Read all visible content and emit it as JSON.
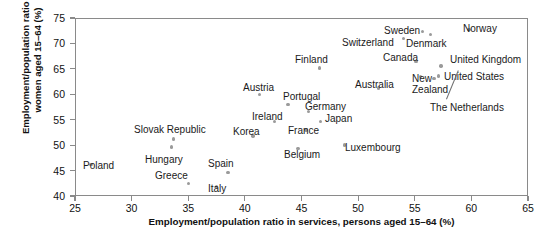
{
  "chart_data": {
    "type": "scatter",
    "title": "",
    "xlabel": "Employment/population ratio in services, persons aged 15–64 (%)",
    "ylabel": "Employment/population ratio for women aged 15–64 (%)",
    "xlim": [
      25,
      65
    ],
    "ylim": [
      40,
      75
    ],
    "xticks": [
      25,
      30,
      35,
      40,
      45,
      50,
      55,
      60,
      65
    ],
    "yticks": [
      40,
      45,
      50,
      55,
      60,
      65,
      70,
      75
    ],
    "grid": false,
    "legend": null,
    "marker_color": "#9a9a9a",
    "frame_color": "#8a8a8a",
    "points": [
      {
        "label": "Poland",
        "x": 26.4,
        "y": 46.2,
        "lx": 83,
        "ly": 161,
        "anchor": "left"
      },
      {
        "label": "Slovak Republic",
        "x": 33.7,
        "y": 51.2,
        "lx": 134,
        "ly": 125,
        "anchor": "left"
      },
      {
        "label": "Hungary",
        "x": 33.5,
        "y": 49.6,
        "lx": 145,
        "ly": 155,
        "anchor": "left"
      },
      {
        "label": "Greece",
        "x": 35.0,
        "y": 42.5,
        "lx": 155,
        "ly": 171,
        "anchor": "left"
      },
      {
        "label": "Spain",
        "x": 38.5,
        "y": 44.6,
        "lx": 208,
        "ly": 159,
        "anchor": "left"
      },
      {
        "label": "Italy",
        "x": 37.5,
        "y": 41.8,
        "lx": 208,
        "ly": 184,
        "anchor": "left"
      },
      {
        "label": "Korea",
        "x": 40.7,
        "y": 51.8,
        "lx": 233,
        "ly": 127,
        "anchor": "left"
      },
      {
        "label": "Ireland",
        "x": 42.6,
        "y": 54.6,
        "lx": 252,
        "ly": 112,
        "anchor": "left"
      },
      {
        "label": "Austria",
        "x": 41.3,
        "y": 60.0,
        "lx": 243,
        "ly": 83,
        "anchor": "left"
      },
      {
        "label": "Belgium",
        "x": 44.7,
        "y": 49.3,
        "lx": 284,
        "ly": 150,
        "anchor": "left"
      },
      {
        "label": "France",
        "x": 45.4,
        "y": 53.0,
        "lx": 288,
        "ly": 126,
        "anchor": "left"
      },
      {
        "label": "Portugal",
        "x": 43.8,
        "y": 58.0,
        "lx": 283,
        "ly": 92,
        "anchor": "left"
      },
      {
        "label": "Germany",
        "x": 45.6,
        "y": 56.6,
        "lx": 305,
        "ly": 102,
        "anchor": "left"
      },
      {
        "label": "Japan",
        "x": 46.7,
        "y": 54.6,
        "lx": 325,
        "ly": 114,
        "anchor": "left"
      },
      {
        "label": "Finland",
        "x": 46.6,
        "y": 65.2,
        "lx": 295,
        "ly": 55,
        "anchor": "left"
      },
      {
        "label": "Luxembourg",
        "x": 48.8,
        "y": 50.0,
        "lx": 345,
        "ly": 143,
        "anchor": "left"
      },
      {
        "label": "Australia",
        "x": 51.8,
        "y": 61.2,
        "lx": 355,
        "ly": 80,
        "anchor": "left"
      },
      {
        "label": "Switzerland",
        "x": 54.0,
        "y": 71.0,
        "lx": 342,
        "ly": 38,
        "anchor": "left"
      },
      {
        "label": "Sweden",
        "x": 55.7,
        "y": 72.4,
        "lx": 384,
        "ly": 26,
        "anchor": "left"
      },
      {
        "label": "Denmark",
        "x": 56.4,
        "y": 71.8,
        "lx": 406,
        "ly": 39,
        "anchor": "left"
      },
      {
        "label": "Canada",
        "x": 55.1,
        "y": 66.5,
        "lx": 383,
        "ly": 53,
        "anchor": "left"
      },
      {
        "label": "Norway",
        "x": 59.8,
        "y": 72.8,
        "lx": 463,
        "ly": 24,
        "anchor": "left"
      },
      {
        "label": "United Kingdom",
        "x": 57.3,
        "y": 65.6,
        "lx": 450,
        "ly": 55,
        "anchor": "left"
      },
      {
        "label": "United States",
        "x": 57.1,
        "y": 63.6,
        "lx": 444,
        "ly": 72,
        "anchor": "left"
      },
      {
        "label": "New\nZealand",
        "x": 55.5,
        "y": 63.5,
        "lx": 412,
        "ly": 74,
        "anchor": "left"
      },
      {
        "label": "The Netherlands",
        "x": 56.7,
        "y": 63.1,
        "lx": 430,
        "ly": 103,
        "anchor": "left"
      }
    ],
    "leader_lines": [
      {
        "from_label": "The Netherlands",
        "x1": 446,
        "y1": 99,
        "x2": 458,
        "y2": 70
      }
    ]
  }
}
